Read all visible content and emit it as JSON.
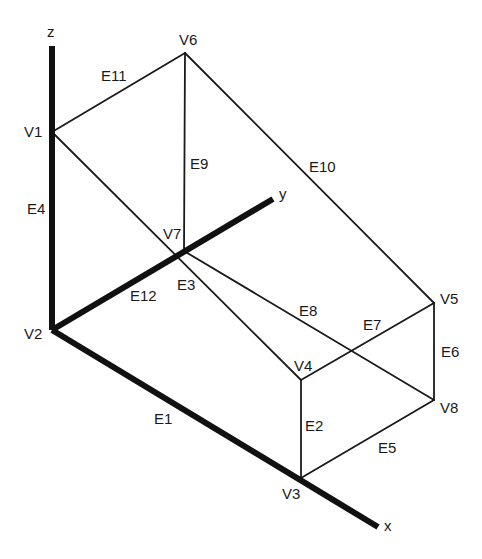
{
  "diagram": {
    "type": "3d-box-wireframe",
    "colors": {
      "line": "#1a1a1a",
      "axis": "#111111",
      "background": "#ffffff"
    },
    "axes": [
      {
        "id": "z",
        "label": "z",
        "from": [
          52,
          330
        ],
        "to": [
          52,
          46
        ],
        "label_pos": [
          47,
          37
        ]
      },
      {
        "id": "y",
        "label": "y",
        "from": [
          52,
          330
        ],
        "to": [
          273,
          199
        ],
        "label_pos": [
          279,
          199
        ]
      },
      {
        "id": "x",
        "label": "x",
        "from": [
          52,
          330
        ],
        "to": [
          378,
          527
        ],
        "label_pos": [
          384,
          531
        ]
      }
    ],
    "vertices": [
      {
        "id": "V1",
        "label": "V1",
        "pos": [
          52,
          132
        ],
        "label_pos": [
          24,
          137
        ]
      },
      {
        "id": "V2",
        "label": "V2",
        "pos": [
          52,
          330
        ],
        "label_pos": [
          24,
          339
        ]
      },
      {
        "id": "V3",
        "label": "V3",
        "pos": [
          301,
          478
        ],
        "label_pos": [
          282,
          499
        ]
      },
      {
        "id": "V4",
        "label": "V4",
        "pos": [
          301,
          380
        ],
        "label_pos": [
          294,
          371
        ]
      },
      {
        "id": "V5",
        "label": "V5",
        "pos": [
          434,
          303
        ],
        "label_pos": [
          440,
          304
        ]
      },
      {
        "id": "V6",
        "label": "V6",
        "pos": [
          185,
          53
        ],
        "label_pos": [
          179,
          45
        ]
      },
      {
        "id": "V7",
        "label": "V7",
        "pos": [
          184,
          251
        ],
        "label_pos": [
          163,
          239
        ]
      },
      {
        "id": "V8",
        "label": "V8",
        "pos": [
          434,
          400
        ],
        "label_pos": [
          440,
          413
        ]
      }
    ],
    "edges": [
      {
        "id": "E1",
        "label": "E1",
        "from": "V2",
        "to": "V3",
        "thick": true,
        "label_pos": [
          154,
          424
        ]
      },
      {
        "id": "E2",
        "label": "E2",
        "from": "V3",
        "to": "V4",
        "thick": false,
        "label_pos": [
          305,
          431
        ]
      },
      {
        "id": "E3",
        "label": "E3",
        "from": "V1",
        "to": "V4",
        "thick": false,
        "label_pos": [
          177,
          290
        ]
      },
      {
        "id": "E4",
        "label": "E4",
        "from": "V1",
        "to": "V2",
        "thick": true,
        "label_pos": [
          27,
          214
        ]
      },
      {
        "id": "E5",
        "label": "E5",
        "from": "V3",
        "to": "V8",
        "thick": false,
        "label_pos": [
          378,
          453
        ]
      },
      {
        "id": "E6",
        "label": "E6",
        "from": "V5",
        "to": "V8",
        "thick": false,
        "label_pos": [
          441,
          357
        ]
      },
      {
        "id": "E7",
        "label": "E7",
        "from": "V4",
        "to": "V5",
        "thick": false,
        "label_pos": [
          363,
          330
        ]
      },
      {
        "id": "E8",
        "label": "E8",
        "from": "V7",
        "to": "V8",
        "thick": false,
        "label_pos": [
          299,
          316
        ]
      },
      {
        "id": "E9",
        "label": "E9",
        "from": "V6",
        "to": "V7",
        "thick": false,
        "label_pos": [
          190,
          169
        ]
      },
      {
        "id": "E10",
        "label": "E10",
        "from": "V6",
        "to": "V5",
        "thick": false,
        "label_pos": [
          309,
          172
        ]
      },
      {
        "id": "E11",
        "label": "E11",
        "from": "V1",
        "to": "V6",
        "thick": false,
        "label_pos": [
          101,
          81
        ]
      },
      {
        "id": "E12",
        "label": "E12",
        "from": "V2",
        "to": "V7",
        "thick": true,
        "label_pos": [
          130,
          301
        ]
      }
    ]
  }
}
